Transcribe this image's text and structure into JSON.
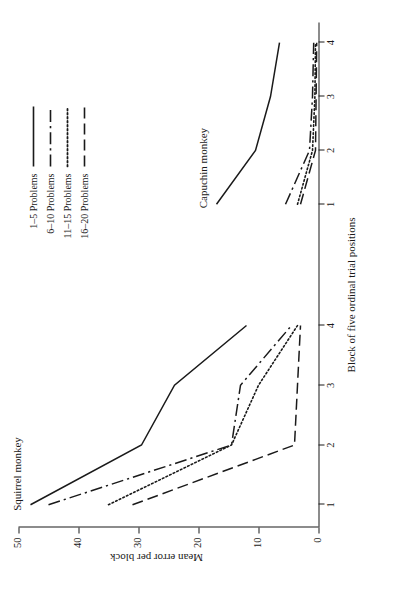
{
  "chart_data": {
    "type": "line",
    "title": "",
    "xlabel": "Block of five ordinal trial positions",
    "ylabel": "Mean error per block",
    "xlim": [
      1,
      4
    ],
    "ylim": [
      0,
      50
    ],
    "x": [
      1,
      2,
      3,
      4
    ],
    "xticks": [
      "1",
      "2",
      "3",
      "4"
    ],
    "yticks": [
      "0",
      "10",
      "20",
      "30",
      "40",
      "50"
    ],
    "ytick_values": [
      0,
      10,
      20,
      30,
      40,
      50
    ],
    "grid": false,
    "legend_position": "top-right",
    "panels": [
      {
        "name": "squirrel",
        "label": "Squirrel monkey",
        "series": [
          {
            "name": "1-5 Problems",
            "style": "solid",
            "x": [
              1,
              2,
              3,
              4
            ],
            "values": [
              48.0,
              29.5,
              24.0,
              12.0
            ]
          },
          {
            "name": "6-10 Problems",
            "style": "dashdot",
            "x": [
              1,
              2,
              3,
              4
            ],
            "values": [
              45.0,
              14.5,
              13.0,
              4.5
            ]
          },
          {
            "name": "11-15 Problems",
            "style": "dotted",
            "x": [
              1,
              2,
              3,
              4
            ],
            "values": [
              35.0,
              14.5,
              10.0,
              3.5
            ]
          },
          {
            "name": "16-20 Problems",
            "style": "dashed",
            "x": [
              1,
              2,
              3,
              4
            ],
            "values": [
              31.0,
              4.0,
              3.5,
              3.0
            ]
          }
        ]
      },
      {
        "name": "capuchin",
        "label": "Capuchin monkey",
        "series": [
          {
            "name": "1-5 Problems",
            "style": "solid",
            "x": [
              1,
              2,
              3,
              4
            ],
            "values": [
              17.0,
              10.5,
              8.0,
              6.5
            ]
          },
          {
            "name": "6-10 Problems",
            "style": "dashdot",
            "x": [
              1,
              2,
              3,
              4
            ],
            "values": [
              5.5,
              1.5,
              1.0,
              0.8
            ]
          },
          {
            "name": "11-15 Problems",
            "style": "dotted",
            "x": [
              1,
              2,
              3,
              4
            ],
            "values": [
              3.5,
              1.0,
              0.6,
              0.5
            ]
          },
          {
            "name": "16-20 Problems",
            "style": "dashed",
            "x": [
              1,
              2,
              3,
              4
            ],
            "values": [
              3.0,
              0.5,
              0.4,
              0.3
            ]
          }
        ]
      }
    ],
    "legend": [
      {
        "label": "1–5 Problems",
        "style": "solid"
      },
      {
        "label": "6–10 Problems",
        "style": "dashdot"
      },
      {
        "label": "11–15 Problems",
        "style": "dotted"
      },
      {
        "label": "16–20 Problems",
        "style": "dashed"
      }
    ],
    "colors": {
      "ink": "#1a1a1a",
      "background": "#ffffff"
    }
  }
}
